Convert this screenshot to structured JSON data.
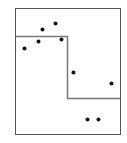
{
  "chart_data": {
    "type": "scatter",
    "title": "",
    "xlabel": "",
    "ylabel": "",
    "xlim": [
      0,
      1
    ],
    "ylim": [
      0,
      1
    ],
    "grid": false,
    "legend": "none",
    "colors": {
      "frame": "#555555",
      "step_line": "#777777",
      "points": "#111111",
      "background": "#ffffff"
    },
    "points": [
      {
        "x": 0.086,
        "y": 0.683
      },
      {
        "x": 0.219,
        "y": 0.738
      },
      {
        "x": 0.257,
        "y": 0.833
      },
      {
        "x": 0.381,
        "y": 0.881
      },
      {
        "x": 0.438,
        "y": 0.754
      },
      {
        "x": 0.552,
        "y": 0.492
      },
      {
        "x": 0.914,
        "y": 0.405
      },
      {
        "x": 0.686,
        "y": 0.119
      },
      {
        "x": 0.79,
        "y": 0.119
      }
    ],
    "step_function": {
      "breakpoint_x": 0.495,
      "levels": [
        {
          "from_x": 0.0,
          "to_x": 0.495,
          "y": 0.778
        },
        {
          "from_x": 0.495,
          "to_x": 1.0,
          "y": 0.286
        }
      ]
    }
  }
}
